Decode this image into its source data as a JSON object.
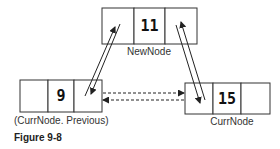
{
  "figure": {
    "caption": "Figure 9-8",
    "nodes": [
      {
        "id": "new",
        "value": "11",
        "label": "NewNode"
      },
      {
        "id": "prev",
        "value": "9",
        "label": "(CurrNode. Previous)"
      },
      {
        "id": "curr",
        "value": "15",
        "label": "CurrNode"
      }
    ],
    "links": [
      {
        "from": "prev",
        "to": "new",
        "style": "solid"
      },
      {
        "from": "new",
        "to": "prev",
        "style": "solid"
      },
      {
        "from": "new",
        "to": "curr",
        "style": "solid"
      },
      {
        "from": "curr",
        "to": "new",
        "style": "solid"
      },
      {
        "from": "prev",
        "to": "curr",
        "style": "dashed"
      },
      {
        "from": "curr",
        "to": "prev",
        "style": "dashed"
      }
    ]
  }
}
